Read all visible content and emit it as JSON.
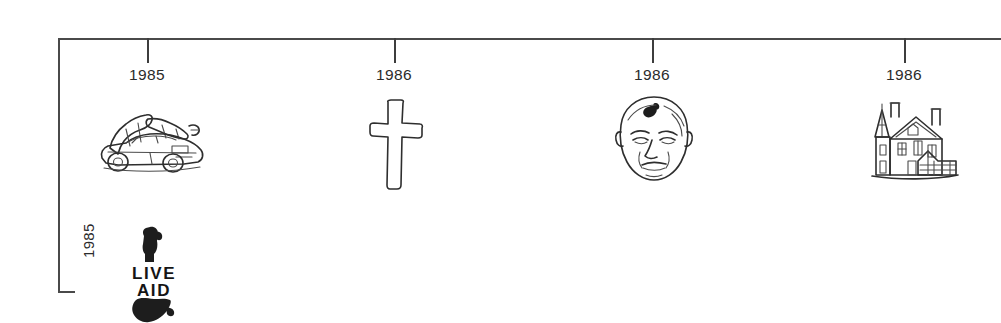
{
  "diagram": {
    "type": "horizontal-timeline",
    "title": "",
    "background_color": "#ffffff",
    "line_color": "#4a4a4a",
    "text_color": "#2b2b2b"
  },
  "axis": {
    "orientation": "horizontal",
    "start_x": 58,
    "end_x": 1001,
    "baseline_y": 38,
    "vertical_drop_height": 254,
    "side_label": "1985"
  },
  "ticks": [
    {
      "label": "1985",
      "x": 147,
      "icon_name": "delorean-car-icon",
      "icon_caption": "DeLorean car with gull-wing doors open"
    },
    {
      "label": "1986",
      "x": 394,
      "icon_name": "cross-icon",
      "icon_caption": "Outlined Christian cross"
    },
    {
      "label": "1986",
      "x": 652,
      "icon_name": "gorbachev-face-icon",
      "icon_caption": "Bald man's face with birthmark"
    },
    {
      "label": "1986",
      "x": 904,
      "icon_name": "victorian-house-icon",
      "icon_caption": "Victorian mansion with turret and porch"
    }
  ],
  "side_entry": {
    "label": "1985",
    "icon_name": "live-aid-logo-icon",
    "logo_line_1": "LIVE",
    "logo_line_2": "AID",
    "icon_caption": "Live Aid logo: guitar neck above, Africa silhouette below"
  }
}
